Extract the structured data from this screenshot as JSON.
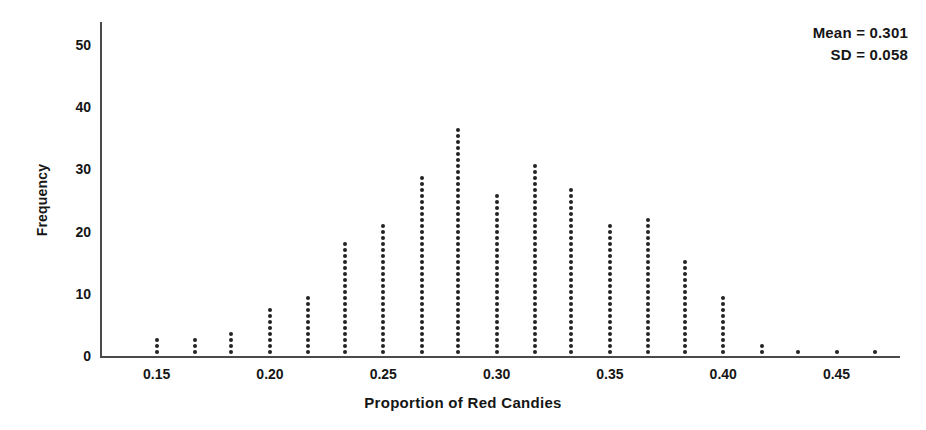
{
  "chart_data": {
    "type": "scatter",
    "plot_style": "dotplot",
    "title": "",
    "xlabel": "Proportion of Red Candies",
    "ylabel": "Frequency",
    "xlim": [
      0.125,
      0.478
    ],
    "ylim": [
      0,
      54
    ],
    "grid": false,
    "legend": null,
    "xticks": [
      0.15,
      0.2,
      0.25,
      0.3,
      0.35,
      0.45
    ],
    "xtick_labels": [
      "0.15",
      "0.20",
      "0.25",
      "0.30",
      "0.35",
      "0.40",
      "0.45"
    ],
    "xtick_values": [
      0.15,
      0.2,
      0.25,
      0.3,
      0.35,
      0.4,
      0.45
    ],
    "yticks": [
      0,
      10,
      20,
      30,
      40,
      50
    ],
    "ytick_labels": [
      "0",
      "10",
      "20",
      "30",
      "40",
      "50"
    ],
    "dot_unit": 1,
    "x": [
      0.15,
      0.167,
      0.183,
      0.2,
      0.217,
      0.233,
      0.25,
      0.267,
      0.283,
      0.3,
      0.317,
      0.333,
      0.35,
      0.367,
      0.383,
      0.4,
      0.417,
      0.433,
      0.45,
      0.467
    ],
    "values": [
      3,
      3,
      4,
      8,
      10,
      19,
      22,
      30,
      38,
      27,
      32,
      28,
      22,
      23,
      16,
      10,
      2,
      1,
      1,
      1
    ],
    "annotations": [
      {
        "name": "mean",
        "text": "Mean = 0.301",
        "value": 0.301
      },
      {
        "name": "sd",
        "text": "SD = 0.058",
        "value": 0.058
      }
    ]
  },
  "annotation": {
    "mean_text": "Mean = 0.301",
    "sd_text": "SD = 0.058"
  },
  "axes": {
    "x_title": "Proportion of Red Candies",
    "y_title": "Frequency"
  }
}
